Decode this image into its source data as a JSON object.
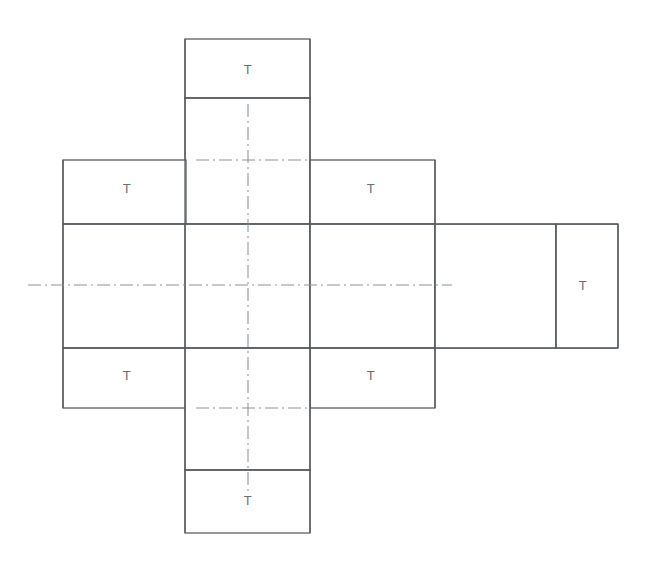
{
  "drawing": {
    "title": "Carton blank / box net development",
    "background_color": "#ffffff",
    "line_color": "#555a5e",
    "centerline_color": "#8d9296",
    "label_color": "#6a6f73",
    "canvas": {
      "width": 647,
      "height": 566
    }
  },
  "panels": [
    {
      "id": "top-tab",
      "name": "top-glue-tab",
      "x": 185,
      "y": 39,
      "width": 125,
      "height": 59,
      "label": "T",
      "label_x": 248,
      "label_y": 71
    },
    {
      "id": "top-panel",
      "name": "top-face-panel",
      "x": 185,
      "y": 98,
      "width": 125,
      "height": 126,
      "label": "",
      "label_x": 248,
      "label_y": 161
    },
    {
      "id": "left-top-tab",
      "name": "left-upper-tab",
      "x": 63,
      "y": 160,
      "width": 123,
      "height": 64,
      "label": "T",
      "label_x": 127,
      "label_y": 190
    },
    {
      "id": "right-top-tab",
      "name": "right-upper-tab",
      "x": 310,
      "y": 160,
      "width": 125,
      "height": 64,
      "label": "T",
      "label_x": 371,
      "label_y": 190
    },
    {
      "id": "left-face",
      "name": "left-face-panel",
      "x": 63,
      "y": 224,
      "width": 123,
      "height": 124,
      "label": "",
      "label_x": 124,
      "label_y": 286
    },
    {
      "id": "center-face",
      "name": "center-face-panel",
      "x": 185,
      "y": 224,
      "width": 125,
      "height": 124,
      "label": "",
      "label_x": 248,
      "label_y": 286
    },
    {
      "id": "right-face",
      "name": "right-face-panel",
      "x": 310,
      "y": 224,
      "width": 125,
      "height": 124,
      "label": "",
      "label_x": 372,
      "label_y": 286
    },
    {
      "id": "far-right-face",
      "name": "far-right-face-panel",
      "x": 435,
      "y": 224,
      "width": 121,
      "height": 124,
      "label": "",
      "label_x": 495,
      "label_y": 286
    },
    {
      "id": "far-right-tab",
      "name": "far-right-glue-tab",
      "x": 556,
      "y": 224,
      "width": 62,
      "height": 124,
      "label": "T",
      "label_x": 583,
      "label_y": 287
    },
    {
      "id": "left-bottom-tab",
      "name": "left-lower-tab",
      "x": 63,
      "y": 348,
      "width": 123,
      "height": 60,
      "label": "T",
      "label_x": 127,
      "label_y": 377
    },
    {
      "id": "right-bottom-tab",
      "name": "right-lower-tab",
      "x": 310,
      "y": 348,
      "width": 125,
      "height": 60,
      "label": "T",
      "label_x": 371,
      "label_y": 377
    },
    {
      "id": "bottom-panel",
      "name": "bottom-face-panel",
      "x": 185,
      "y": 348,
      "width": 125,
      "height": 122,
      "label": "",
      "label_x": 248,
      "label_y": 409
    },
    {
      "id": "bottom-tab",
      "name": "bottom-glue-tab",
      "x": 185,
      "y": 470,
      "width": 125,
      "height": 63,
      "label": "T",
      "label_x": 248,
      "label_y": 502
    }
  ],
  "fold_lines": [
    {
      "name": "fold-top-tab",
      "x1": 185,
      "y1": 98,
      "x2": 310,
      "y2": 98
    },
    {
      "name": "fold-upper-band",
      "x1": 63,
      "y1": 224,
      "x2": 618,
      "y2": 224
    },
    {
      "name": "fold-lower-band",
      "x1": 63,
      "y1": 348,
      "x2": 618,
      "y2": 348
    },
    {
      "name": "fold-bottom-tab",
      "x1": 185,
      "y1": 470,
      "x2": 310,
      "y2": 470
    },
    {
      "name": "fold-center-left",
      "x1": 185,
      "y1": 39,
      "x2": 185,
      "y2": 533
    },
    {
      "name": "fold-center-right",
      "x1": 310,
      "y1": 39,
      "x2": 310,
      "y2": 533
    },
    {
      "name": "fold-left-edge",
      "x1": 63,
      "y1": 160,
      "x2": 63,
      "y2": 408
    },
    {
      "name": "fold-right-edge",
      "x1": 435,
      "y1": 160,
      "x2": 435,
      "y2": 408
    },
    {
      "name": "fold-far-right-divider",
      "x1": 556,
      "y1": 224,
      "x2": 556,
      "y2": 348
    },
    {
      "name": "fold-far-right-edge",
      "x1": 618,
      "y1": 224,
      "x2": 618,
      "y2": 348
    }
  ],
  "center_lines": [
    {
      "name": "centerline-vertical",
      "x1": 248,
      "y1": 104,
      "x2": 248,
      "y2": 492,
      "orientation": "vertical"
    },
    {
      "name": "centerline-horizontal-main",
      "x1": 28,
      "y1": 285,
      "x2": 452,
      "y2": 285,
      "orientation": "horizontal"
    },
    {
      "name": "centerline-horizontal-upper",
      "x1": 196,
      "y1": 160,
      "x2": 318,
      "y2": 160,
      "orientation": "horizontal"
    },
    {
      "name": "centerline-horizontal-lower",
      "x1": 196,
      "y1": 408,
      "x2": 318,
      "y2": 408,
      "orientation": "horizontal"
    }
  ],
  "labels": {
    "tab_marker": "T",
    "tab_count": 6
  }
}
